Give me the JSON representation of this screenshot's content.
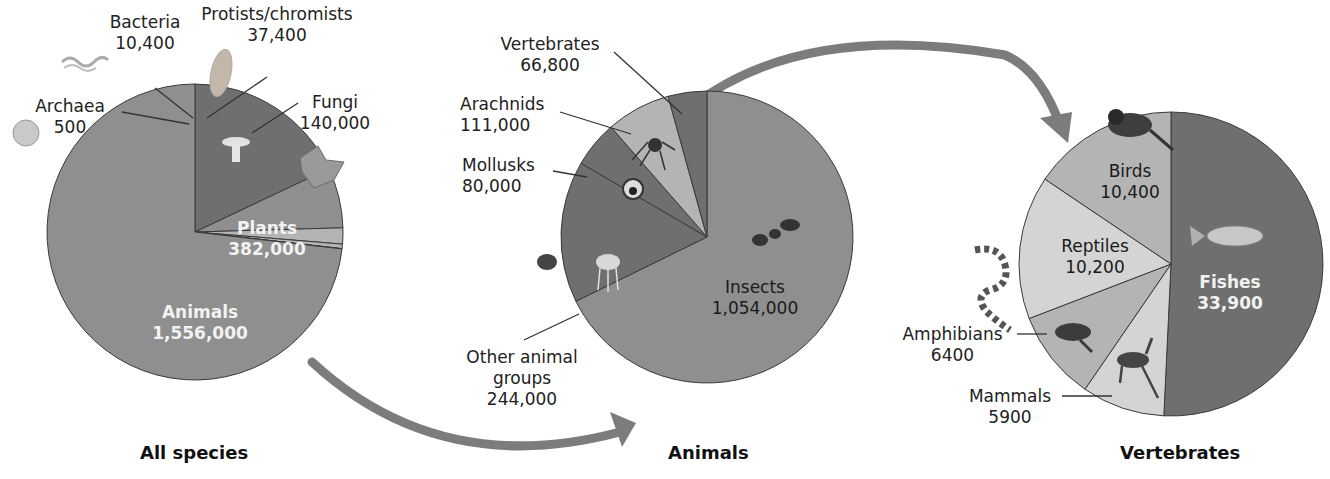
{
  "colors": {
    "dark": "#6f6f6f",
    "mid": "#8f8f8f",
    "light": "#b4b4b4",
    "lighter": "#d4d4d4",
    "arrow": "#7c7c7c",
    "outline": "#3a3a3a"
  },
  "chart_data": [
    {
      "type": "pie",
      "title": "All species",
      "categories": [
        "Animals",
        "Archaea",
        "Bacteria",
        "Protists/chromists",
        "Fungi",
        "Plants"
      ],
      "values": [
        1556000,
        500,
        10400,
        37400,
        140000,
        382000
      ],
      "labels": {
        "animals": {
          "name": "Animals",
          "value": "1,556,000"
        },
        "archaea": {
          "name": "Archaea",
          "value": "500"
        },
        "bacteria": {
          "name": "Bacteria",
          "value": "10,400"
        },
        "protists": {
          "name": "Protists/chromists",
          "value": "37,400"
        },
        "fungi": {
          "name": "Fungi",
          "value": "140,000"
        },
        "plants": {
          "name": "Plants",
          "value": "382,000"
        }
      }
    },
    {
      "type": "pie",
      "title": "Animals",
      "categories": [
        "Insects",
        "Other animal groups",
        "Mollusks",
        "Arachnids",
        "Vertebrates"
      ],
      "values": [
        1054000,
        244000,
        80000,
        111000,
        66800
      ],
      "labels": {
        "insects": {
          "name": "Insects",
          "value": "1,054,000"
        },
        "other": {
          "name1": "Other animal",
          "name2": "groups",
          "value": "244,000"
        },
        "mollusks": {
          "name": "Mollusks",
          "value": "80,000"
        },
        "arachnids": {
          "name": "Arachnids",
          "value": "111,000"
        },
        "vertebrates": {
          "name": "Vertebrates",
          "value": "66,800"
        }
      }
    },
    {
      "type": "pie",
      "title": "Vertebrates",
      "categories": [
        "Fishes",
        "Mammals",
        "Amphibians",
        "Reptiles",
        "Birds"
      ],
      "values": [
        33900,
        5900,
        6400,
        10200,
        10400
      ],
      "labels": {
        "fishes": {
          "name": "Fishes",
          "value": "33,900"
        },
        "mammals": {
          "name": "Mammals",
          "value": "5900"
        },
        "amphibians": {
          "name": "Amphibians",
          "value": "6400"
        },
        "reptiles": {
          "name": "Reptiles",
          "value": "10,200"
        },
        "birds": {
          "name": "Birds",
          "value": "10,400"
        }
      }
    }
  ]
}
